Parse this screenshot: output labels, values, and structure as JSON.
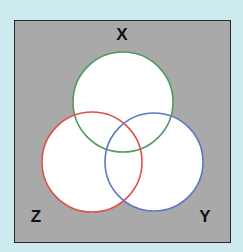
{
  "diagram": {
    "type": "venn",
    "background_color": "#cdeaee",
    "universe_color": "#a9a9a9",
    "universe_border_color": "#2a2a2a",
    "sets": [
      {
        "name": "X",
        "label": "X",
        "color": "#4f9a5e",
        "cx": 123,
        "cy": 102,
        "r": 50,
        "label_x": 122,
        "label_y": 34
      },
      {
        "name": "Z",
        "label": "Z",
        "color": "#e0504a",
        "cx": 92,
        "cy": 162,
        "r": 50,
        "label_x": 36,
        "label_y": 216
      },
      {
        "name": "Y",
        "label": "Y",
        "color": "#5b78c2",
        "cx": 154,
        "cy": 162,
        "r": 49,
        "label_x": 205,
        "label_y": 216
      }
    ],
    "fill_color": "#ffffff"
  }
}
